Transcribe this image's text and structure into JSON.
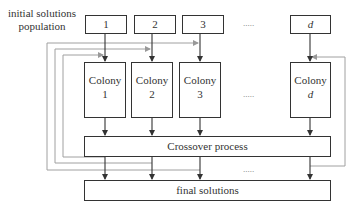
{
  "diagram": {
    "input_label": "initial solutions population",
    "input_label_lines": [
      "initial solutions",
      "population"
    ],
    "top_boxes": [
      {
        "label": "1",
        "italic": false
      },
      {
        "label": "2",
        "italic": false
      },
      {
        "label": "3",
        "italic": false
      },
      {
        "label": "d",
        "italic": true
      }
    ],
    "colonies": [
      {
        "line1": "Colony",
        "line2": "1"
      },
      {
        "line1": "Colony",
        "line2": "2"
      },
      {
        "line1": "Colony",
        "line2": "3"
      },
      {
        "line1": "Colony",
        "line2": "d"
      }
    ],
    "ellipsis": ".....",
    "crossover_label": "Crossover process",
    "final_label": "final solutions",
    "colors": {
      "box_stroke": "#333333",
      "arrow": "#333333",
      "feedback_line": "#999999"
    }
  }
}
